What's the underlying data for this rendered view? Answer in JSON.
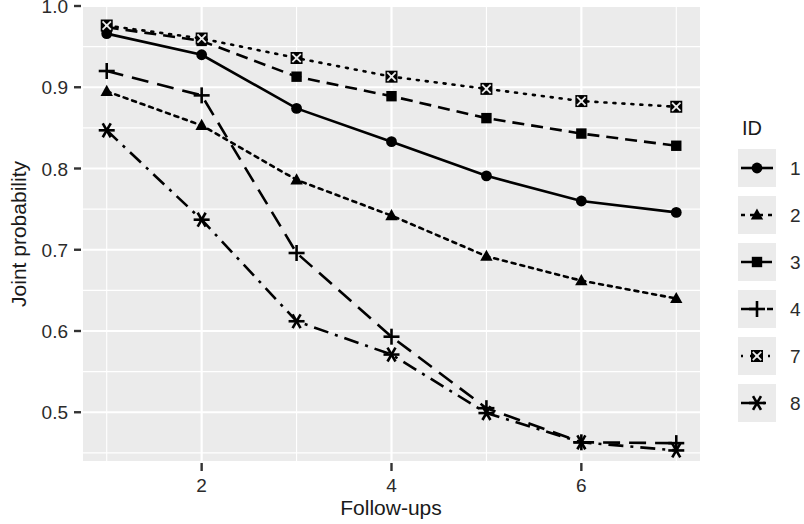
{
  "chart_data": {
    "type": "line",
    "title": "",
    "xlabel": "Follow-ups",
    "ylabel": "Joint probability",
    "legend_title": "ID",
    "legend_position": "right",
    "grid": true,
    "panel_background": "#ebebeb",
    "grid_color": "#ffffff",
    "line_color": "#000000",
    "x": [
      1,
      2,
      3,
      4,
      5,
      6,
      7
    ],
    "xlim": [
      0.75,
      7.25
    ],
    "ylim": [
      0.44,
      1.0
    ],
    "xticks": [
      2,
      4,
      6
    ],
    "xtick_labels": [
      "2",
      "4",
      "6"
    ],
    "yticks": [
      0.5,
      0.6,
      0.7,
      0.8,
      0.9,
      1.0
    ],
    "ytick_labels": [
      "0.5",
      "0.6",
      "0.7",
      "0.8",
      "0.9",
      "1.0"
    ],
    "series": [
      {
        "name": "1",
        "marker": "circle",
        "linestyle": "solid",
        "values": [
          0.966,
          0.94,
          0.874,
          0.833,
          0.791,
          0.76,
          0.746
        ]
      },
      {
        "name": "2",
        "marker": "triangle",
        "linestyle": "dotted",
        "values": [
          0.895,
          0.853,
          0.786,
          0.742,
          0.692,
          0.662,
          0.64
        ]
      },
      {
        "name": "3",
        "marker": "square",
        "linestyle": "dashed",
        "values": [
          0.974,
          0.957,
          0.913,
          0.889,
          0.862,
          0.843,
          0.828
        ]
      },
      {
        "name": "4",
        "marker": "plus",
        "linestyle": "longdash",
        "values": [
          0.92,
          0.89,
          0.696,
          0.593,
          0.505,
          0.463,
          0.462
        ]
      },
      {
        "name": "7",
        "marker": "crossed-square",
        "linestyle": "fine-dotted",
        "values": [
          0.976,
          0.96,
          0.936,
          0.913,
          0.898,
          0.883,
          0.876
        ]
      },
      {
        "name": "8",
        "marker": "asterisk",
        "linestyle": "dashdot",
        "values": [
          0.847,
          0.737,
          0.612,
          0.571,
          0.499,
          0.463,
          0.453
        ]
      }
    ]
  }
}
